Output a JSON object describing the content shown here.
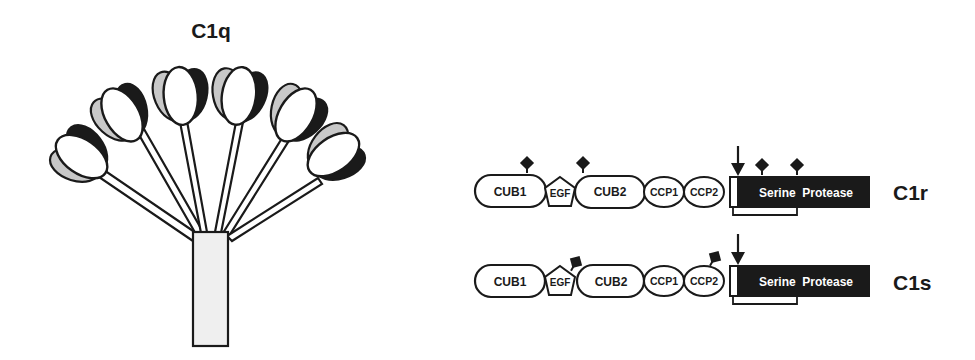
{
  "c1q": {
    "title": "C1q",
    "colors": {
      "head_light": "#c8c8c8",
      "head_dark": "#1a1a1a",
      "head_center": "#ffffff",
      "stalk": "#efefef",
      "stroke": "#1a1a1a"
    },
    "head_count": 6
  },
  "c1r": {
    "label": "C1r",
    "domains": [
      "CUB1",
      "EGF",
      "CUB2",
      "CCP1",
      "CCP2"
    ],
    "protease_label": "Serine  Protease",
    "glycosylation_sites": [
      "CUB1",
      "CUB2",
      "Serine Protease",
      "Serine Protease"
    ],
    "cleavage_arrow": "activation-cleavage-site"
  },
  "c1s": {
    "label": "C1s",
    "domains": [
      "CUB1",
      "EGF",
      "CUB2",
      "CCP1",
      "CCP2"
    ],
    "protease_label": "Serine  Protease",
    "glycosylation_sites": [
      "EGF",
      "CCP2"
    ],
    "cleavage_arrow": "activation-cleavage-site"
  },
  "colors": {
    "ink": "#1a1a1a",
    "protease_fill": "#1a1a1a",
    "protease_text": "#ffffff",
    "paper": "#ffffff"
  }
}
